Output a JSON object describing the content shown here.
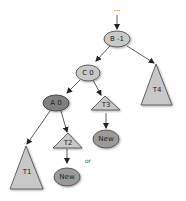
{
  "diagram": {
    "type": "tree",
    "top_ellipsis": "...",
    "nodes": {
      "B": {
        "label": "B -1",
        "shape": "ellipse",
        "fill": "#c8c8c8"
      },
      "C": {
        "label": "C 0",
        "shape": "ellipse",
        "fill": "#c8c8c8"
      },
      "A": {
        "label": "A 0",
        "shape": "ellipse",
        "fill": "#808080"
      },
      "T1": {
        "label": "T1",
        "shape": "triangle",
        "fill": "#c8c8c8"
      },
      "T2": {
        "label": "T2",
        "shape": "triangle",
        "fill": "#c8c8c8"
      },
      "T3": {
        "label": "T3",
        "shape": "triangle",
        "fill": "#c8c8c8"
      },
      "T4": {
        "label": "T4",
        "shape": "triangle",
        "fill": "#c8c8c8"
      },
      "New1": {
        "label": "New",
        "shape": "ellipse",
        "fill": "#9a9a9a"
      },
      "New2": {
        "label": "New",
        "shape": "ellipse",
        "fill": "#9a9a9a"
      }
    },
    "edges": [
      [
        "...",
        "B"
      ],
      [
        "B",
        "C"
      ],
      [
        "B",
        "T4"
      ],
      [
        "C",
        "A"
      ],
      [
        "C",
        "T3"
      ],
      [
        "A",
        "T1"
      ],
      [
        "A",
        "T2"
      ],
      [
        "T2",
        "New2"
      ],
      [
        "T3",
        "New1"
      ]
    ],
    "or_label": "or"
  }
}
